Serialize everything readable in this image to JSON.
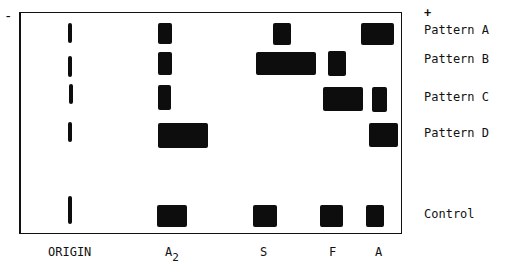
{
  "figure": {
    "polarity": {
      "negative": "-",
      "positive": "+"
    },
    "rows": [
      {
        "label": "Pattern A",
        "y": 23,
        "h": 22
      },
      {
        "label": "Pattern B",
        "y": 52,
        "h": 24
      },
      {
        "label": "Pattern C",
        "y": 87,
        "h": 24
      },
      {
        "label": "Pattern D",
        "y": 123,
        "h": 25
      },
      {
        "label": "Control",
        "y": 205,
        "h": 22
      }
    ],
    "columns": [
      {
        "label": "ORIGIN"
      },
      {
        "label": "A",
        "subscript": "2"
      },
      {
        "label": "S"
      },
      {
        "label": "F"
      },
      {
        "label": "A"
      }
    ],
    "bands": [
      {
        "row": "Pattern A",
        "x": 158,
        "y": 23,
        "w": 14,
        "h": 21
      },
      {
        "row": "Pattern A",
        "x": 273,
        "y": 23,
        "w": 18,
        "h": 22
      },
      {
        "row": "Pattern A",
        "x": 361,
        "y": 23,
        "w": 33,
        "h": 22
      },
      {
        "row": "Pattern B",
        "x": 158,
        "y": 52,
        "w": 14,
        "h": 23
      },
      {
        "row": "Pattern B",
        "x": 256,
        "y": 52,
        "w": 60,
        "h": 23
      },
      {
        "row": "Pattern B",
        "x": 328,
        "y": 51,
        "w": 18,
        "h": 25
      },
      {
        "row": "Pattern C",
        "x": 158,
        "y": 85,
        "w": 13,
        "h": 25
      },
      {
        "row": "Pattern C",
        "x": 323,
        "y": 87,
        "w": 40,
        "h": 24
      },
      {
        "row": "Pattern C",
        "x": 372,
        "y": 87,
        "w": 15,
        "h": 25
      },
      {
        "row": "Pattern D",
        "x": 158,
        "y": 123,
        "w": 50,
        "h": 25
      },
      {
        "row": "Pattern D",
        "x": 369,
        "y": 123,
        "w": 29,
        "h": 24
      },
      {
        "row": "Control",
        "x": 157,
        "y": 205,
        "w": 30,
        "h": 22
      },
      {
        "row": "Control",
        "x": 253,
        "y": 205,
        "w": 24,
        "h": 22
      },
      {
        "row": "Control",
        "x": 320,
        "y": 205,
        "w": 23,
        "h": 22
      },
      {
        "row": "Control",
        "x": 366,
        "y": 205,
        "w": 18,
        "h": 22
      }
    ],
    "origin_marks": [
      {
        "x": 68,
        "y": 23,
        "h": 20
      },
      {
        "x": 68,
        "y": 56,
        "h": 21
      },
      {
        "x": 69,
        "y": 84,
        "h": 20
      },
      {
        "x": 68,
        "y": 122,
        "h": 20
      },
      {
        "x": 68,
        "y": 196,
        "h": 28
      }
    ]
  }
}
